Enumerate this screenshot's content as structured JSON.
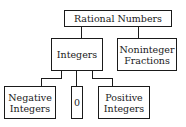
{
  "diagram": {
    "root": {
      "label": "Rational Numbers"
    },
    "level1": [
      {
        "label": "Integers"
      },
      {
        "label": "Noninteger Fractions",
        "lines": [
          "Noninteger",
          "Fractions"
        ]
      }
    ],
    "level2": [
      {
        "label": "Negative Integers",
        "lines": [
          "Negative",
          "Integers"
        ]
      },
      {
        "label": "0"
      },
      {
        "label": "Positive Integers",
        "lines": [
          "Positive",
          "Integers"
        ]
      }
    ]
  }
}
